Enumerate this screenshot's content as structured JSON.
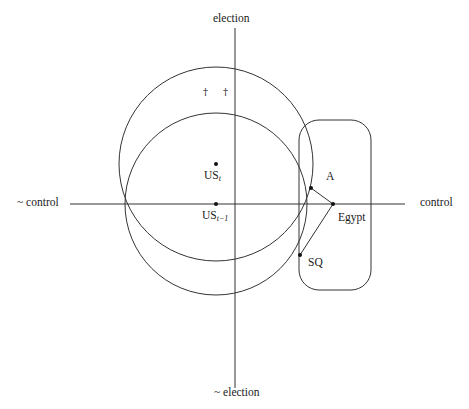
{
  "diagram": {
    "axes": {
      "top_label": "election",
      "bottom_label": "~ election",
      "left_label": "~ control",
      "right_label": "control"
    },
    "points": {
      "us_t": {
        "label_main": "US",
        "label_sub": "t",
        "x": 216,
        "y": 164
      },
      "us_t_minus_1": {
        "label_main": "US",
        "label_sub": "t−1",
        "x": 216,
        "y": 204
      },
      "a": {
        "label": "A",
        "x": 311,
        "y": 188
      },
      "egypt": {
        "label": "Egypt",
        "x": 333,
        "y": 204
      },
      "sq": {
        "label": "SQ",
        "x": 300,
        "y": 255
      }
    },
    "circles": [
      {
        "name": "circle-us-t",
        "cx": 216,
        "cy": 164,
        "r": 97
      },
      {
        "name": "circle-us-t-minus-1",
        "cx": 216,
        "cy": 204,
        "r": 91
      }
    ],
    "region_box": {
      "x": 299,
      "y": 120,
      "width": 72,
      "height": 170,
      "rx": 20
    },
    "daggers": [
      "†",
      "†"
    ],
    "colors": {
      "line": "#333333",
      "point": "#111111",
      "background": "#ffffff"
    }
  }
}
